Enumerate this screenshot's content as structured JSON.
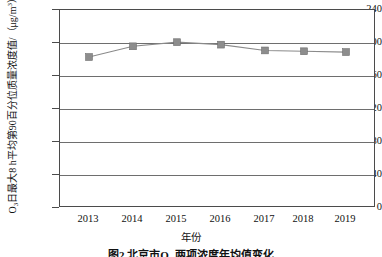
{
  "chart_data": {
    "type": "line",
    "title": "",
    "caption": "图2  北京市O₃ 两项浓度年均值变化",
    "xlabel": "年份",
    "ylabel": "O₃日最大8 h平均第90百分位质量浓度值/（μg/m³）",
    "ylabel_main": "O",
    "ylabel_sub": "3",
    "ylabel_rest": "日最大8 h平均第90百分位质量浓度值/（μg/m",
    "ylabel_unit_sup": "3",
    "ylabel_tail": "）",
    "categories": [
      "2013",
      "2014",
      "2015",
      "2016",
      "2017",
      "2018",
      "2019"
    ],
    "values": [
      183,
      196,
      201,
      198,
      191,
      190,
      189
    ],
    "series": [
      {
        "name": "O₃日最大8 h平均第90百分位质量浓度值",
        "values": [
          183,
          196,
          201,
          198,
          191,
          190,
          189
        ]
      }
    ],
    "ylim": [
      0,
      240
    ],
    "yticks": [
      "0",
      "40",
      "80",
      "120",
      "160",
      "200",
      "240"
    ],
    "ytick_values": [
      0,
      40,
      80,
      120,
      160,
      200,
      240
    ],
    "xticks": [
      "2013",
      "2014",
      "2015",
      "2016",
      "2017",
      "2018",
      "2019"
    ],
    "grid": "horizontal",
    "legend": "none",
    "marker": "square",
    "marker_color": "#8d8d8d",
    "line_color": "#8a8a8a",
    "axis_color": "#4b4b4b",
    "background": "#ffffff"
  }
}
